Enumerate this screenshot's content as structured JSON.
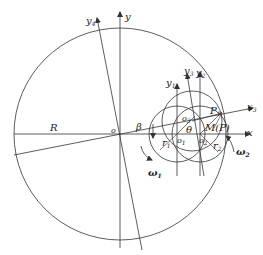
{
  "diagram": {
    "type": "kinematic-geometry",
    "labels": {
      "y": "y",
      "y4": "y",
      "y4_sub": "4",
      "y1": "y",
      "y1_sub": "1",
      "y2": "y",
      "y2_sub": "2",
      "y3": "y",
      "y3_sub": "3",
      "x": "x",
      "x3": "x",
      "x3_sub": "3",
      "R": "R",
      "o": "o",
      "beta": "β",
      "theta": "θ",
      "omega1": "ω",
      "omega1_sub": "1",
      "omega2": "ω",
      "omega2_sub": "2",
      "r1": "r",
      "r1_sub": "1",
      "r2": "r",
      "r2_sub": "2",
      "O1": "o",
      "O1_sub": "1",
      "O2": "o",
      "O2_sub": "2",
      "O3": "o",
      "O3_sub": "3",
      "P1": "P",
      "P1_sub": "1",
      "MP": "M(P)"
    },
    "colors": {
      "stroke": "#333333",
      "text": "#222222",
      "background": "#ffffff"
    }
  }
}
